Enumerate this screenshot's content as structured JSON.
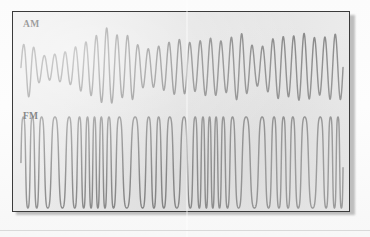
{
  "figure": {
    "caption_labels": {
      "am": "AM",
      "fm": "FM"
    },
    "background_color": "#e9e9e9",
    "page_color": "#fdfdfd",
    "trace_color": "#7c7c7c",
    "border_color": "#3b3b3b",
    "label_color": "#2d2d2d"
  },
  "chart_data": [
    {
      "type": "line",
      "title": "AM",
      "xlabel": "",
      "ylabel": "",
      "grid": false,
      "legend": "none",
      "description": "Amplitude-modulated carrier: constant frequency, varying peak amplitude following an audio envelope.",
      "xlim": [
        0,
        1
      ],
      "ylim": [
        -1,
        1
      ],
      "carrier_cycles": 31,
      "carrier_frequency_rel": 1.0,
      "envelope_samples": [
        0.52,
        0.74,
        0.41,
        0.3,
        0.33,
        0.36,
        0.41,
        0.52,
        0.63,
        0.71,
        0.86,
        1.0,
        0.83,
        0.76,
        0.84,
        0.56,
        0.47,
        0.5,
        0.57,
        0.64,
        0.71,
        0.66,
        0.6,
        0.68,
        0.74,
        0.7,
        0.63,
        0.78,
        0.86,
        0.62,
        0.47,
        0.55,
        0.72,
        0.8,
        0.74,
        0.81,
        0.86,
        0.78,
        0.7,
        0.79,
        0.84,
        0.8
      ]
    },
    {
      "type": "line",
      "title": "FM",
      "xlabel": "",
      "ylabel": "",
      "grid": false,
      "legend": "none",
      "description": "Frequency-modulated carrier: constant peak amplitude, varying instantaneous frequency.",
      "xlim": [
        0,
        1
      ],
      "ylim": [
        -1,
        1
      ],
      "amplitude": 1.0,
      "frequency_samples": [
        1.0,
        1.05,
        1.1,
        0.78,
        0.66,
        0.62,
        0.7,
        0.88,
        1.12,
        1.32,
        1.42,
        1.3,
        1.05,
        0.74,
        0.58,
        0.56,
        0.66,
        0.84,
        1.02,
        0.88,
        0.7,
        0.62,
        0.72,
        0.98,
        1.3,
        1.48,
        1.44,
        1.2,
        0.92,
        0.7,
        0.58,
        0.56,
        0.64,
        0.8,
        0.96,
        1.06,
        1.0,
        0.82,
        0.62,
        0.56,
        0.7,
        1.05,
        1.35,
        1.4
      ],
      "base_cycles": 31
    }
  ]
}
